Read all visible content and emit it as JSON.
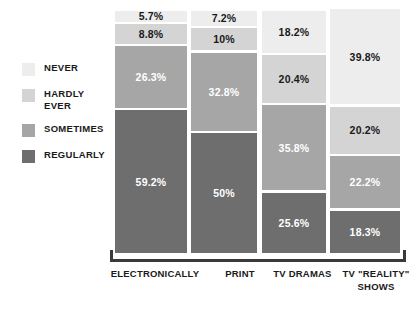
{
  "chart_data": {
    "type": "bar",
    "stacked": true,
    "stack_mode": "percent",
    "title": "",
    "subtitle": "",
    "xlabel": "",
    "ylabel": "",
    "ylim": [
      0,
      100
    ],
    "grid": false,
    "legend_position": "left",
    "categories": [
      "ELECTRONICALLY",
      "PRINT",
      "TV DRAMAS",
      "TV \"REALITY\"\nSHOWS"
    ],
    "series": [
      {
        "name": "NEVER",
        "color": "#ededed",
        "text_color": "#1a1a1a",
        "values": [
          5.7,
          7.2,
          18.2,
          39.8
        ],
        "labels": [
          "5.7%",
          "7.2%",
          "18.2%",
          "39.8%"
        ]
      },
      {
        "name": "HARDLY\nEVER",
        "color": "#d4d4d4",
        "text_color": "#1a1a1a",
        "values": [
          8.8,
          10,
          20.4,
          20.2
        ],
        "labels": [
          "8.8%",
          "10%",
          "20.4%",
          "20.2%"
        ]
      },
      {
        "name": "SOMETIMES",
        "color": "#a6a6a6",
        "text_color": "#ffffff",
        "values": [
          26.3,
          32.8,
          35.8,
          22.2
        ],
        "labels": [
          "26.3%",
          "32.8%",
          "35.8%",
          "22.2%"
        ]
      },
      {
        "name": "REGULARLY",
        "color": "#6e6e6e",
        "text_color": "#ffffff",
        "values": [
          59.2,
          50,
          25.6,
          18.3
        ],
        "labels": [
          "59.2%",
          "50%",
          "25.6%",
          "18.3%"
        ]
      }
    ]
  },
  "legend": {
    "items": [
      {
        "label": "NEVER",
        "color": "#ededed"
      },
      {
        "label": "HARDLY\nEVER",
        "color": "#d4d4d4"
      },
      {
        "label": "SOMETIMES",
        "color": "#a6a6a6"
      },
      {
        "label": "REGULARLY",
        "color": "#6e6e6e"
      }
    ]
  },
  "axis": {
    "line_color": "#3a3a3a"
  },
  "bar_geometry": [
    {
      "left": 2,
      "width": 72
    },
    {
      "left": 78,
      "width": 66
    },
    {
      "left": 149,
      "width": 64
    },
    {
      "left": 217,
      "width": 70
    }
  ],
  "category_geometry": [
    {
      "left": 0,
      "width": 110
    },
    {
      "left": 105,
      "width": 70
    },
    {
      "left": 160,
      "width": 85
    },
    {
      "left": 236,
      "width": 80
    }
  ]
}
